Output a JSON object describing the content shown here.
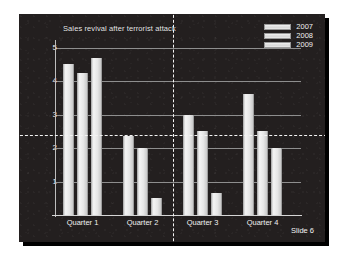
{
  "slide": {
    "number_label": "Slide 6",
    "background_color": "#231f1f",
    "text_color": "#f0f0f0"
  },
  "chart_data": {
    "type": "bar",
    "title": "Sales revival after terrorist attack",
    "xlabel": "",
    "ylabel": "",
    "categories": [
      "Quarter 1",
      "Quarter 2",
      "Quarter 3",
      "Quarter 4"
    ],
    "series": [
      {
        "name": "2007",
        "values": [
          4.5,
          2.35,
          3.0,
          3.6
        ]
      },
      {
        "name": "2008",
        "values": [
          4.25,
          2.0,
          2.5,
          2.5
        ]
      },
      {
        "name": "2009",
        "values": [
          4.7,
          0.5,
          0.65,
          2.0
        ]
      }
    ],
    "ylim": [
      0,
      5.2
    ],
    "yticks": [
      1,
      2,
      3,
      4,
      5
    ],
    "ytick_labels": [
      "1",
      "2",
      "3",
      "4",
      "5"
    ],
    "grid": true,
    "legend_position": "top-right",
    "bar_color": "#e6e6e6",
    "grid_color": "#8e8e8e",
    "annotations": {
      "horizontal_guide_value": 2.4,
      "vertical_guide_between": "Quarter 2 / Quarter 3",
      "guide_color": "#f4f4f4",
      "guide_style": "dashed"
    }
  }
}
